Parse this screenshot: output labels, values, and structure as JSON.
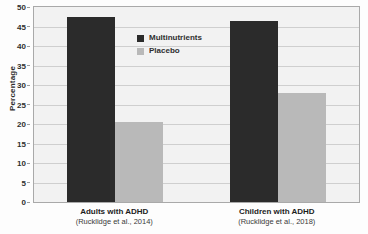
{
  "chart_data": {
    "type": "bar",
    "title": "",
    "xlabel": "",
    "ylabel": "Percentage",
    "ylim": [
      0,
      50
    ],
    "yticks": [
      0,
      5,
      10,
      15,
      20,
      25,
      30,
      35,
      40,
      45,
      50
    ],
    "grid": true,
    "legend_position": "inside-top-center",
    "categories": [
      "Adults with ADHD",
      "Children with ADHD"
    ],
    "category_sources": [
      "(Rucklidge et al., 2014)",
      "(Rucklidge et al., 2018)"
    ],
    "series": [
      {
        "name": "Multinutrients",
        "values": [
          47.5,
          46.5
        ],
        "color": "#2b2b2b"
      },
      {
        "name": "Placebo",
        "values": [
          20.5,
          28.0
        ],
        "color": "#b9b9b9"
      }
    ]
  },
  "colors": {
    "plot_background": "#f2f2f2",
    "page_background": "#fdfdfd",
    "gridline": "#cfcfcf",
    "frame": "#a9a9a9",
    "text": "#2f2f2f"
  }
}
